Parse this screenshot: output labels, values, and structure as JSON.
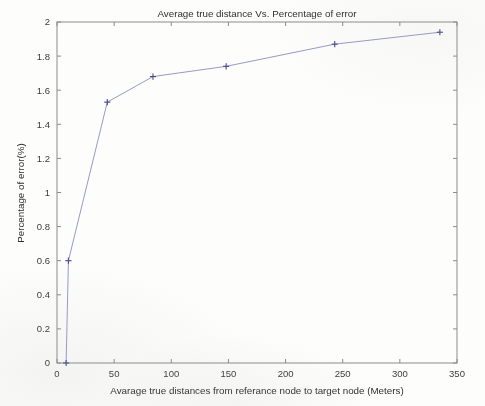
{
  "chart_data": {
    "type": "line",
    "title": "Average true distance Vs. Percentage of error",
    "xlabel": "Avarage true distances from referance node to target node (Meters)",
    "ylabel": "Percentage of error(%)",
    "xlim": [
      0,
      350
    ],
    "ylim": [
      0,
      2
    ],
    "xticks": [
      0,
      50,
      100,
      150,
      200,
      250,
      300,
      350
    ],
    "yticks": [
      0,
      0.2,
      0.4,
      0.6,
      0.8,
      1,
      1.2,
      1.4,
      1.6,
      1.8,
      2
    ],
    "xtick_labels": [
      "0",
      "50",
      "100",
      "150",
      "200",
      "250",
      "300",
      "350"
    ],
    "ytick_labels": [
      "0",
      "0.2",
      "0.4",
      "0.6",
      "0.8",
      "1",
      "1.2",
      "1.4",
      "1.6",
      "1.8",
      "2"
    ],
    "grid": false,
    "legend": null,
    "marker": "plus",
    "line_color": "#8a8fbe",
    "marker_color": "#4a4d8c",
    "series": [
      {
        "name": "Percentage of error",
        "x": [
          8,
          10,
          44,
          84,
          148,
          243,
          335
        ],
        "y": [
          0,
          0.6,
          1.53,
          1.68,
          1.74,
          1.87,
          1.94
        ]
      }
    ]
  }
}
